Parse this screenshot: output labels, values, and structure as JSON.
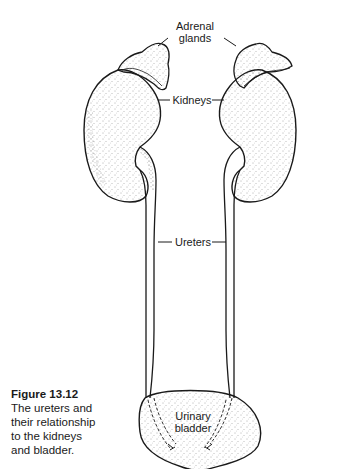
{
  "figure": {
    "number": "Figure 13.12",
    "caption_lines": [
      "The ureters and",
      "their relationship",
      "to the kidneys",
      "and bladder."
    ]
  },
  "labels": {
    "adrenal_line1": "Adrenal",
    "adrenal_line2": "glands",
    "kidneys": "Kidneys",
    "ureters": "Ureters",
    "bladder_line1": "Urinary",
    "bladder_line2": "bladder"
  },
  "colors": {
    "ink": "#1a1a1a",
    "stipple": "#555555",
    "background": "#ffffff"
  }
}
